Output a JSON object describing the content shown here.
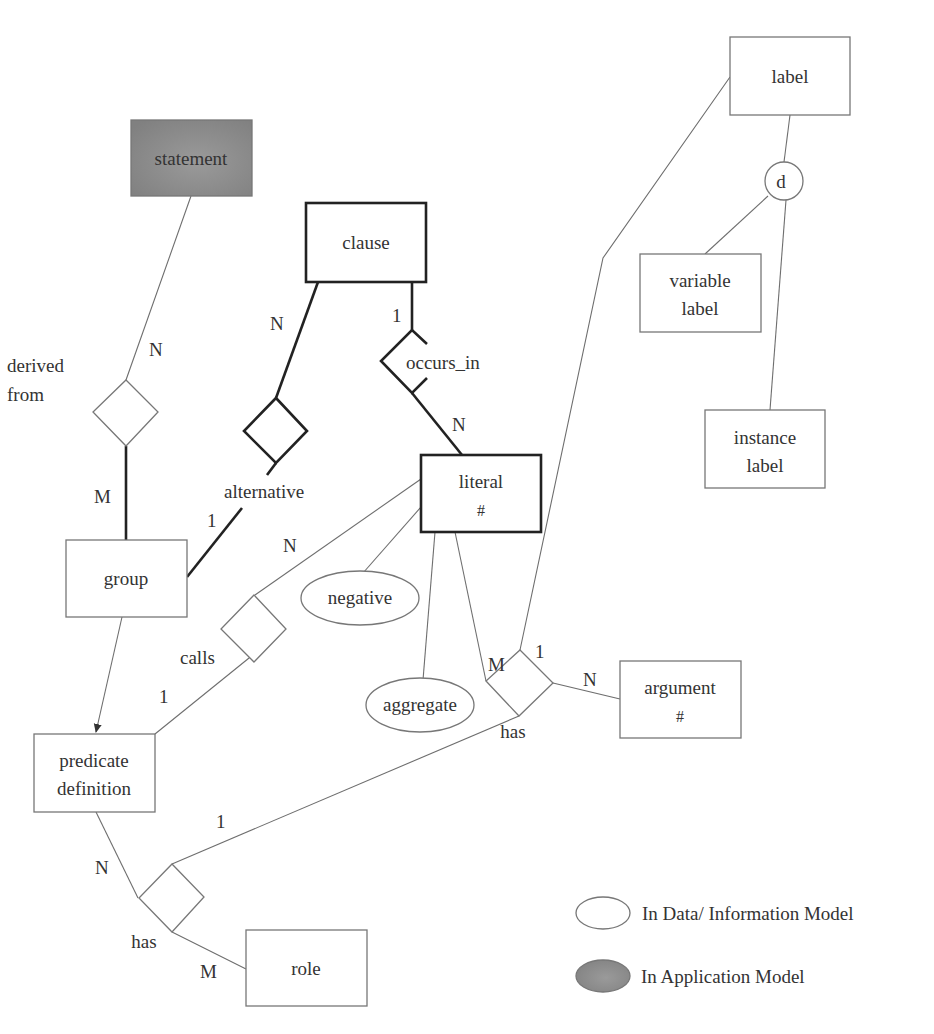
{
  "diagram": {
    "type": "entity-relationship",
    "colors": {
      "application_model_fill": "#8c8c8c",
      "line_thin": "#6e6e6e",
      "line_bold": "#222222"
    },
    "entities": {
      "statement": {
        "label": "statement",
        "model": "application"
      },
      "clause": {
        "label": "clause",
        "model": "data"
      },
      "label": {
        "label": "label",
        "model": "data"
      },
      "variable_label": {
        "line1": "variable",
        "line2": "label",
        "model": "data"
      },
      "instance_label": {
        "line1": "instance",
        "line2": "label",
        "model": "data"
      },
      "literal": {
        "line1": "literal",
        "line2": "#",
        "model": "data"
      },
      "group": {
        "label": "group",
        "model": "data"
      },
      "argument": {
        "line1": "argument",
        "line2": "#",
        "model": "data"
      },
      "predicate_definition": {
        "line1": "predicate",
        "line2": "definition",
        "model": "data"
      },
      "role": {
        "label": "role",
        "model": "data"
      }
    },
    "attributes": {
      "negative": "negative",
      "aggregate": "aggregate"
    },
    "specialization": {
      "symbol": "d"
    },
    "relationships": {
      "derived_from": {
        "line1": "derived",
        "line2": "from"
      },
      "alternative": {
        "label": "alternative"
      },
      "occurs_in": {
        "label": "occurs_in"
      },
      "calls": {
        "label": "calls"
      },
      "has_literal_argument": {
        "label": "has"
      },
      "has_predicate_role": {
        "label": "has"
      }
    },
    "cardinalities": {
      "statement_derived_from": "N",
      "group_derived_from": "M",
      "clause_alternative": "N",
      "group_alternative": "1",
      "clause_occurs_in": "1",
      "literal_occurs_in": "N",
      "literal_calls": "N",
      "predicate_calls": "1",
      "literal_has": "M",
      "label_has": "1",
      "argument_has": "N",
      "has_predicate_role_top": "1",
      "predicate_has": "N",
      "role_has": "M"
    }
  },
  "legend": {
    "items": [
      {
        "label": "In Data/ Information Model",
        "fill": "#ffffff"
      },
      {
        "label": "In Application Model",
        "fill": "#8c8c8c"
      }
    ]
  }
}
